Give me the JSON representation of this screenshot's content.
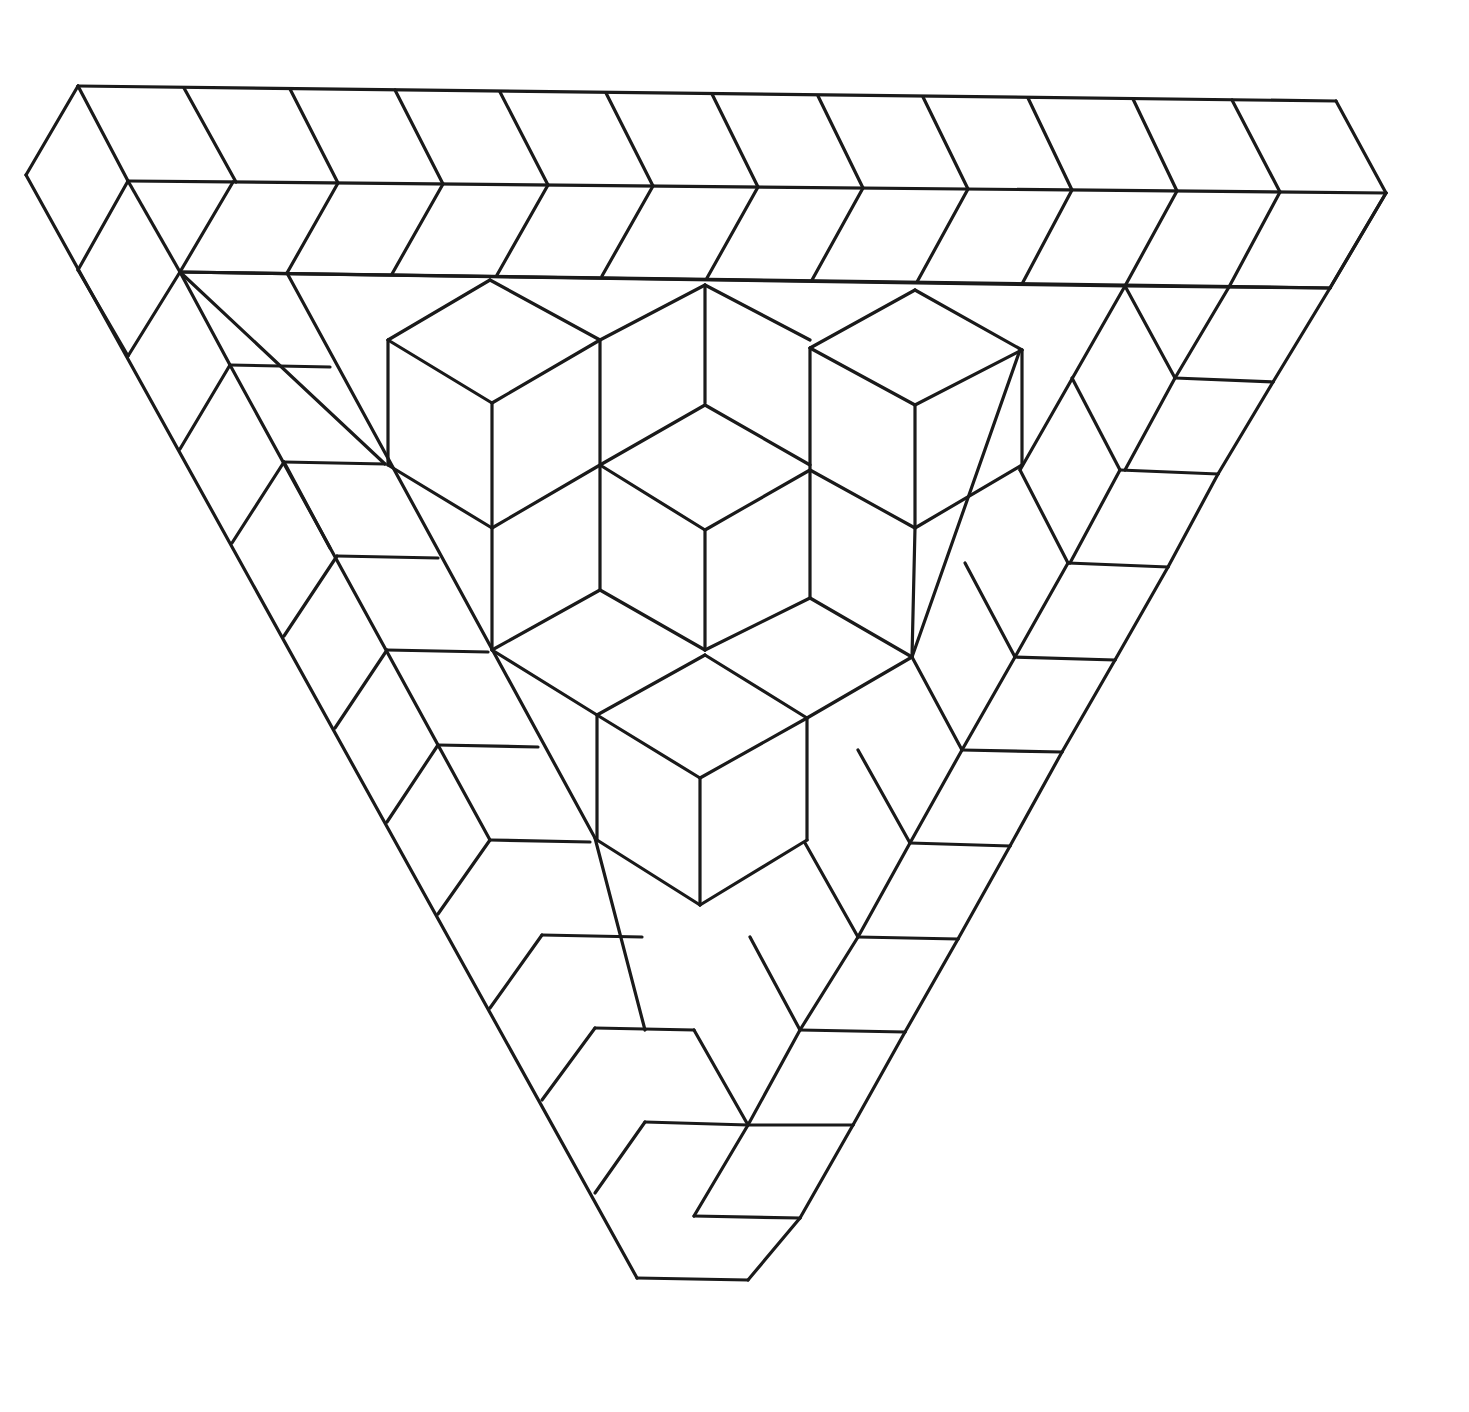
{
  "figure": {
    "background": "#ffffff",
    "stroke": "#1a1a1a",
    "stroke_width": 3.2
  },
  "frame": {
    "top_edge": {
      "outer": [
        [
          78,
          86
        ],
        [
          1336,
          101
        ]
      ],
      "middle": [
        [
          128,
          181
        ],
        [
          1386,
          193
        ]
      ],
      "inner": [
        [
          180,
          272
        ],
        [
          1330,
          288
        ]
      ],
      "tick_x_outer": [
        78,
        184,
        290,
        395,
        500,
        606,
        712,
        818,
        923,
        1028,
        1133,
        1232,
        1336
      ],
      "tick_x_middle": [
        128,
        233,
        338,
        443,
        548,
        653,
        758,
        863,
        968,
        1072,
        1177,
        1280,
        1386
      ]
    },
    "left_edge": {
      "outer": [
        [
          26,
          175
        ],
        [
          637,
          1278
        ]
      ],
      "diag2": [
        [
          78,
          86
        ],
        [
          128,
          181
        ]
      ]
    },
    "bottom_tip": [
      [
        637,
        1278
      ],
      [
        748,
        1280
      ]
    ]
  },
  "cubes": {
    "count": 6,
    "description": "Six cubes arranged in a triangular cluster at center (three top, two middle, one bottom-front)"
  },
  "lines": [
    [
      78,
      86,
      1336,
      101
    ],
    [
      128,
      181,
      1386,
      193
    ],
    [
      180,
      272,
      1330,
      288
    ],
    [
      78,
      86,
      26,
      175
    ],
    [
      26,
      175,
      637,
      1278
    ],
    [
      78,
      86,
      128,
      181
    ],
    [
      184,
      88,
      236,
      182
    ],
    [
      290,
      89,
      338,
      183
    ],
    [
      395,
      90,
      443,
      184
    ],
    [
      500,
      92,
      548,
      185
    ],
    [
      606,
      93,
      653,
      186
    ],
    [
      712,
      94,
      758,
      187
    ],
    [
      818,
      96,
      863,
      188
    ],
    [
      923,
      97,
      968,
      189
    ],
    [
      1028,
      98,
      1072,
      190
    ],
    [
      1133,
      99,
      1177,
      191
    ],
    [
      1232,
      100,
      1280,
      192
    ],
    [
      1336,
      101,
      1386,
      193
    ],
    [
      128,
      181,
      78,
      270
    ],
    [
      233,
      182,
      180,
      272
    ],
    [
      338,
      183,
      287,
      273
    ],
    [
      443,
      184,
      392,
      274
    ],
    [
      548,
      185,
      497,
      275
    ],
    [
      653,
      186,
      602,
      276
    ],
    [
      758,
      187,
      707,
      278
    ],
    [
      863,
      188,
      812,
      280
    ],
    [
      968,
      189,
      917,
      282
    ],
    [
      1072,
      190,
      1022,
      284
    ],
    [
      1177,
      191,
      1125,
      286
    ],
    [
      1280,
      192,
      1229,
      287
    ],
    [
      1386,
      193,
      1330,
      288
    ],
    [
      128,
      181,
      180,
      272
    ],
    [
      180,
      272,
      230,
      365
    ],
    [
      78,
      270,
      128,
      356
    ],
    [
      1330,
      288,
      1273,
      382
    ],
    [
      1273,
      382,
      1218,
      474
    ],
    [
      1218,
      474,
      1168,
      567
    ],
    [
      1168,
      567,
      1115,
      660
    ],
    [
      1115,
      660,
      1062,
      752
    ],
    [
      1062,
      752,
      1010,
      846
    ],
    [
      1010,
      846,
      958,
      939
    ],
    [
      958,
      939,
      905,
      1032
    ],
    [
      905,
      1032,
      853,
      1125
    ],
    [
      853,
      1125,
      800,
      1218
    ],
    [
      800,
      1218,
      748,
      1280
    ],
    [
      1386,
      193,
      1330,
      288
    ],
    [
      637,
      1278,
      748,
      1280
    ],
    [
      230,
      365,
      330,
      367
    ],
    [
      284,
      462,
      385,
      464
    ],
    [
      337,
      556,
      438,
      558
    ],
    [
      387,
      650,
      488,
      652
    ],
    [
      438,
      745,
      538,
      747
    ],
    [
      490,
      840,
      590,
      842
    ],
    [
      542,
      935,
      642,
      937
    ],
    [
      595,
      1028,
      694,
      1030
    ],
    [
      645,
      1122,
      748,
      1125
    ],
    [
      694,
      1216,
      800,
      1218
    ],
    [
      128,
      356,
      180,
      272
    ],
    [
      180,
      449,
      230,
      365
    ],
    [
      232,
      543,
      284,
      462
    ],
    [
      284,
      636,
      337,
      556
    ],
    [
      335,
      728,
      387,
      650
    ],
    [
      387,
      822,
      438,
      745
    ],
    [
      438,
      914,
      490,
      840
    ],
    [
      490,
      1008,
      542,
      935
    ],
    [
      542,
      1100,
      595,
      1028
    ],
    [
      595,
      1193,
      645,
      1122
    ],
    [
      180,
      272,
      1125,
      286
    ],
    [
      230,
      365,
      490,
      840
    ],
    [
      284,
      462,
      330,
      548
    ],
    [
      180,
      272,
      385,
      464
    ],
    [
      287,
      273,
      595,
      838
    ],
    [
      595,
      838,
      645,
      1030
    ],
    [
      1125,
      286,
      1175,
      378
    ],
    [
      1175,
      378,
      1125,
      470
    ],
    [
      1072,
      378,
      1120,
      470
    ],
    [
      1120,
      470,
      1070,
      563
    ],
    [
      1020,
      470,
      1068,
      563
    ],
    [
      1068,
      563,
      1015,
      657
    ],
    [
      965,
      563,
      1015,
      657
    ],
    [
      1015,
      657,
      962,
      750
    ],
    [
      912,
      657,
      962,
      750
    ],
    [
      962,
      750,
      910,
      843
    ],
    [
      858,
      750,
      910,
      843
    ],
    [
      910,
      843,
      858,
      937
    ],
    [
      805,
      843,
      858,
      937
    ],
    [
      858,
      937,
      800,
      1030
    ],
    [
      750,
      937,
      800,
      1030
    ],
    [
      800,
      1030,
      748,
      1125
    ],
    [
      694,
      1030,
      748,
      1125
    ],
    [
      748,
      1125,
      694,
      1216
    ],
    [
      1175,
      378,
      1273,
      382
    ],
    [
      1120,
      470,
      1218,
      474
    ],
    [
      1068,
      563,
      1168,
      567
    ],
    [
      1015,
      657,
      1115,
      660
    ],
    [
      962,
      750,
      1062,
      752
    ],
    [
      910,
      843,
      1010,
      846
    ],
    [
      858,
      937,
      958,
      939
    ],
    [
      800,
      1030,
      905,
      1032
    ],
    [
      748,
      1125,
      853,
      1125
    ],
    [
      1330,
      288,
      1125,
      286
    ],
    [
      1229,
      287,
      1175,
      378
    ],
    [
      1020,
      350,
      912,
      657
    ],
    [
      1125,
      286,
      1020,
      470
    ],
    [
      490,
      280,
      388,
      340
    ],
    [
      490,
      280,
      600,
      340
    ],
    [
      388,
      340,
      492,
      403
    ],
    [
      492,
      403,
      600,
      340
    ],
    [
      388,
      340,
      388,
      465
    ],
    [
      492,
      403,
      492,
      528
    ],
    [
      600,
      340,
      600,
      465
    ],
    [
      388,
      465,
      492,
      528
    ],
    [
      492,
      528,
      600,
      465
    ],
    [
      705,
      285,
      600,
      340
    ],
    [
      705,
      285,
      810,
      340
    ],
    [
      705,
      285,
      705,
      403
    ],
    [
      600,
      465,
      705,
      405
    ],
    [
      705,
      405,
      810,
      465
    ],
    [
      915,
      290,
      810,
      348
    ],
    [
      915,
      290,
      1022,
      350
    ],
    [
      810,
      348,
      915,
      405
    ],
    [
      915,
      405,
      1022,
      350
    ],
    [
      810,
      348,
      810,
      470
    ],
    [
      915,
      405,
      915,
      528
    ],
    [
      1022,
      350,
      1022,
      465
    ],
    [
      810,
      470,
      915,
      528
    ],
    [
      915,
      528,
      1022,
      465
    ],
    [
      600,
      465,
      705,
      530
    ],
    [
      705,
      530,
      810,
      470
    ],
    [
      600,
      465,
      600,
      590
    ],
    [
      705,
      530,
      705,
      650
    ],
    [
      810,
      470,
      810,
      598
    ],
    [
      492,
      528,
      492,
      650
    ],
    [
      600,
      590,
      492,
      650
    ],
    [
      600,
      590,
      705,
      650
    ],
    [
      705,
      650,
      810,
      598
    ],
    [
      810,
      598,
      912,
      657
    ],
    [
      915,
      528,
      912,
      657
    ],
    [
      492,
      650,
      597,
      715
    ],
    [
      597,
      715,
      705,
      655
    ],
    [
      705,
      655,
      807,
      718
    ],
    [
      807,
      718,
      912,
      657
    ],
    [
      597,
      715,
      597,
      840
    ],
    [
      597,
      715,
      700,
      778
    ],
    [
      700,
      778,
      807,
      718
    ],
    [
      807,
      718,
      807,
      840
    ],
    [
      700,
      778,
      700,
      905
    ],
    [
      597,
      840,
      700,
      905
    ],
    [
      700,
      905,
      807,
      840
    ]
  ]
}
